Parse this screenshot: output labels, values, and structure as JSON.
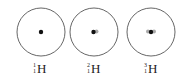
{
  "colors": {
    "orbit": "#555555",
    "nucleus_proton": "#111111",
    "nucleus_neutron": "#aaaaaa",
    "text": "#222222"
  },
  "isotopes": [
    {
      "name": "protium",
      "mass_number": "1",
      "atomic_number": "1",
      "symbol": "H",
      "protons": 1,
      "neutrons": 0,
      "center": [
        41,
        32
      ],
      "radius": 24
    },
    {
      "name": "deuterium",
      "mass_number": "2",
      "atomic_number": "1",
      "symbol": "H",
      "protons": 1,
      "neutrons": 1,
      "center": [
        94,
        32
      ],
      "radius": 24
    },
    {
      "name": "tritium",
      "mass_number": "3",
      "atomic_number": "1",
      "symbol": "H",
      "protons": 1,
      "neutrons": 2,
      "center": [
        151,
        32
      ],
      "radius": 24
    }
  ]
}
